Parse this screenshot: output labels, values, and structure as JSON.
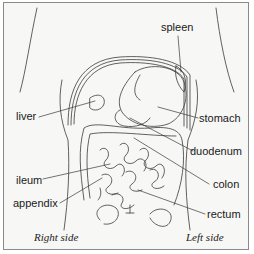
{
  "diagram": {
    "labels": {
      "spleen": "spleen",
      "liver": "liver",
      "stomach": "stomach",
      "duodenum": "duodenum",
      "colon": "colon",
      "ileum": "ileum",
      "appendix": "appendix",
      "rectum": "rectum"
    },
    "orientation": {
      "right": "Right side",
      "left": "Left side"
    },
    "colors": {
      "line": "#3a3a3a",
      "background": "#f7f7f5",
      "border": "#8a8a8a"
    }
  }
}
